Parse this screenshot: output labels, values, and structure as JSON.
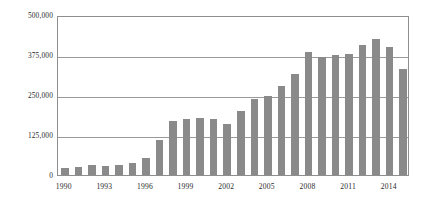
{
  "chart_data": {
    "type": "bar",
    "title": "",
    "subtitle": "",
    "xlabel": "",
    "ylabel": "",
    "grid": true,
    "legend": false,
    "legend_position": "none",
    "bar_color": "#8a8a8a",
    "axis_color": "#8e8e8e",
    "gridline_color": "#9a9a9a",
    "text_color": "#2b2b2b",
    "ylim": [
      0,
      500000
    ],
    "y_ticks": [
      0,
      125000,
      250000,
      375000,
      500000
    ],
    "y_tick_labels": [
      "0",
      "125,000",
      "250,000",
      "375,000",
      "500,000"
    ],
    "x_tick_labels": [
      "1990",
      "1993",
      "1996",
      "1999",
      "2002",
      "2005",
      "2008",
      "2011",
      "2014"
    ],
    "x_tick_categories": [
      "1990",
      "1993",
      "1996",
      "1999",
      "2002",
      "2005",
      "2008",
      "2011",
      "2014"
    ],
    "categories": [
      "1990",
      "1991",
      "1992",
      "1993",
      "1994",
      "1995",
      "1996",
      "1997",
      "1998",
      "1999",
      "2000",
      "2001",
      "2002",
      "2003",
      "2004",
      "2005",
      "2006",
      "2007",
      "2008",
      "2009",
      "2010",
      "2011",
      "2012",
      "2013",
      "2014",
      "2015"
    ],
    "values": [
      22000,
      25000,
      32000,
      28000,
      30000,
      38000,
      52000,
      110000,
      170000,
      175000,
      178000,
      175000,
      160000,
      200000,
      238000,
      248000,
      278000,
      315000,
      385000,
      370000,
      375000,
      378000,
      405000,
      425000,
      400000,
      330000
    ]
  }
}
